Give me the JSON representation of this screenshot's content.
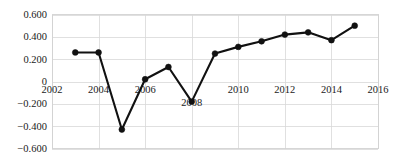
{
  "chart_data": {
    "type": "line",
    "title": "",
    "subtitle": "",
    "xlabel": "",
    "ylabel": "",
    "x": [
      2003,
      2004,
      2005,
      2006,
      2007,
      2008,
      2009,
      2010,
      2011,
      2012,
      2013,
      2014,
      2015
    ],
    "values": [
      0.26,
      0.26,
      -0.43,
      0.02,
      0.13,
      -0.18,
      0.25,
      0.31,
      0.36,
      0.42,
      0.44,
      0.37,
      0.5
    ],
    "series": [
      {
        "name": "series-1",
        "values": [
          0.26,
          0.26,
          -0.43,
          0.02,
          0.13,
          -0.18,
          0.25,
          0.31,
          0.36,
          0.42,
          0.44,
          0.37,
          0.5
        ]
      }
    ],
    "xlim": [
      2002,
      2016
    ],
    "ylim": [
      -0.6,
      0.6
    ],
    "xticks": [
      2002,
      2004,
      2006,
      2008,
      2010,
      2012,
      2014,
      2016
    ],
    "xtick_labels": [
      "2002",
      "2004",
      "2006",
      "2008",
      "2010",
      "2012",
      "2014",
      "2016"
    ],
    "yticks": [
      0.6,
      0.4,
      0.2,
      0,
      -0.2,
      -0.4,
      -0.6
    ],
    "ytick_labels": [
      "0.600",
      "0.400",
      "0.200",
      "0",
      "−0.200",
      "−0.400",
      "−0.600"
    ],
    "grid": true,
    "legend": null,
    "legend_position": "none",
    "marker": "circle",
    "line_color": "#111111",
    "marker_color": "#111111",
    "grid_color": "#d8d8d8",
    "background_color": "#ffffff"
  }
}
